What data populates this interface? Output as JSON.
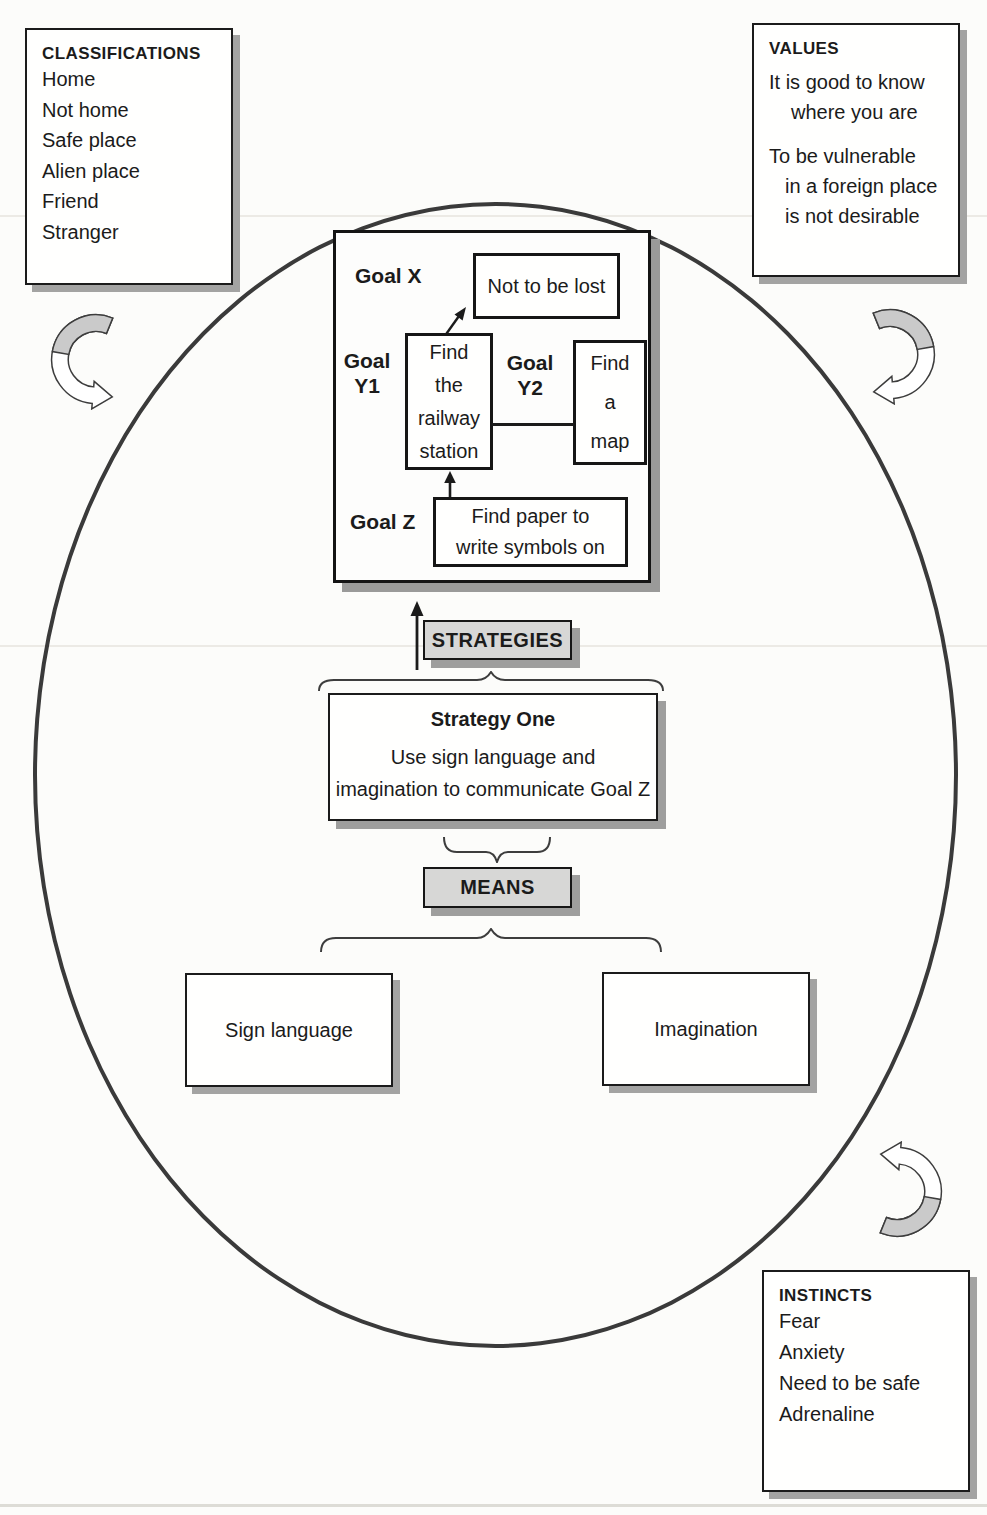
{
  "classifications": {
    "title": "CLASSIFICATIONS",
    "items": [
      "Home",
      "Not home",
      "Safe place",
      "Alien place",
      "Friend",
      "Stranger"
    ]
  },
  "values": {
    "title": "VALUES",
    "lines": [
      "It is good to know",
      "where you are",
      "To be vulnerable",
      "in a foreign place",
      "is not desirable"
    ]
  },
  "instincts": {
    "title": "INSTINCTS",
    "items": [
      "Fear",
      "Anxiety",
      "Need to be safe",
      "Adrenaline"
    ]
  },
  "goals": {
    "x_label": "Goal X",
    "x_box": "Not to be lost",
    "y1_label": [
      "Goal",
      "Y1"
    ],
    "y1_box": [
      "Find",
      "the",
      "railway",
      "station"
    ],
    "y2_label": [
      "Goal",
      "Y2"
    ],
    "y2_box": [
      "Find",
      "a",
      "map"
    ],
    "z_label": "Goal Z",
    "z_box": [
      "Find paper to",
      "write symbols on"
    ]
  },
  "strategies": {
    "label": "STRATEGIES"
  },
  "strategy_one": {
    "title": "Strategy One",
    "lines": [
      "Use sign language and",
      "imagination to communicate Goal Z"
    ]
  },
  "means": {
    "label": "MEANS",
    "boxes": [
      "Sign language",
      "Imagination"
    ]
  },
  "colors": {
    "ink": "#1b1b1b",
    "panel_shadow": "#9e9e9d",
    "label_fill": "#d7d7d6",
    "arrow_gray": "#cacaca",
    "paper": "#fcfcfa"
  }
}
